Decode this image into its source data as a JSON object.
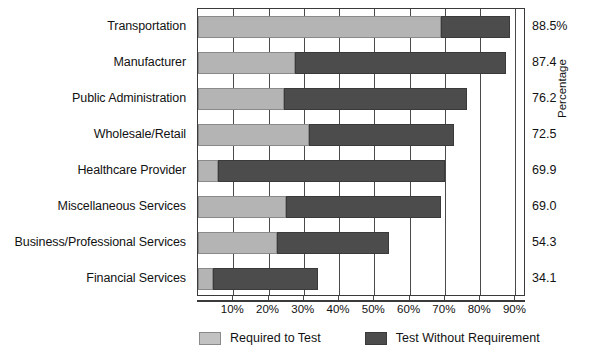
{
  "chart_data": {
    "type": "bar",
    "orientation": "horizontal",
    "stacked": true,
    "title": "",
    "xlabel": "",
    "ylabel": "Percentage",
    "xlim": [
      0,
      93
    ],
    "xticks": [
      "10%",
      "20%",
      "30%",
      "40%",
      "50%",
      "60%",
      "70%",
      "80%",
      "90%"
    ],
    "xtick_values": [
      10,
      20,
      30,
      40,
      50,
      60,
      70,
      80,
      90
    ],
    "grid": true,
    "legend_position": "bottom",
    "categories": [
      "Transportation",
      "Manufacturer",
      "Public Administration",
      "Wholesale/Retail",
      "Healthcare Provider",
      "Miscellaneous Services",
      "Business/Professional Services",
      "Financial Services"
    ],
    "series": [
      {
        "name": "Required to Test",
        "color": "#b4b4b4",
        "values": [
          69.0,
          27.5,
          24.5,
          31.5,
          5.7,
          25.0,
          22.5,
          4.3
        ]
      },
      {
        "name": "Test Without Requirement",
        "color": "#4c4c4c",
        "values": [
          19.5,
          59.9,
          51.7,
          41.0,
          64.2,
          44.0,
          31.8,
          29.8
        ]
      }
    ],
    "totals": [
      88.5,
      87.4,
      76.2,
      72.5,
      69.9,
      69.0,
      54.3,
      34.1
    ],
    "total_labels": [
      "88.5%",
      "87.4",
      "76.2",
      "72.5",
      "69.9",
      "69.0",
      "54.3",
      "34.1"
    ]
  },
  "legend": {
    "items": [
      {
        "label": "Required to Test",
        "swatch": "light-gray-swatch"
      },
      {
        "label": "Test Without Requirement",
        "swatch": "dark-gray-swatch"
      }
    ]
  },
  "axis": {
    "vertical_title": "Percentage"
  }
}
